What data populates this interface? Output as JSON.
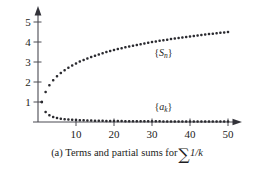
{
  "caption": {
    "prefix": "(a) Terms and partial sums for",
    "sigma": "∑",
    "expression": "1/k",
    "full": "(a) Terms and partial sums for ∑1/k"
  },
  "chart_data": {
    "type": "scatter",
    "title": "",
    "subtitle": "",
    "xlabel": "",
    "ylabel": "",
    "xlim": [
      0,
      52
    ],
    "ylim": [
      0,
      5.4
    ],
    "grid": false,
    "legend_position": "inline-annotation",
    "xticks": [
      10,
      20,
      30,
      40,
      50
    ],
    "xtick_labels": [
      "10",
      "20",
      "30",
      "40",
      "50"
    ],
    "yticks": [
      1,
      2,
      3,
      4,
      5
    ],
    "ytick_labels": [
      "1",
      "2",
      "3",
      "4",
      "5"
    ],
    "x": [
      1,
      2,
      3,
      4,
      5,
      6,
      7,
      8,
      9,
      10,
      11,
      12,
      13,
      14,
      15,
      16,
      17,
      18,
      19,
      20,
      21,
      22,
      23,
      24,
      25,
      26,
      27,
      28,
      29,
      30,
      31,
      32,
      33,
      34,
      35,
      36,
      37,
      38,
      39,
      40,
      41,
      42,
      43,
      44,
      45,
      46,
      47,
      48,
      49,
      50
    ],
    "series": [
      {
        "name": "{S_n}",
        "label_base": "S",
        "label_sub": "n",
        "description": "partial sums of the harmonic series",
        "annotation_x": 33,
        "annotation_y": 3.3,
        "values": [
          1.0,
          1.5,
          1.833,
          2.083,
          2.283,
          2.45,
          2.593,
          2.718,
          2.829,
          2.929,
          3.02,
          3.103,
          3.18,
          3.252,
          3.318,
          3.381,
          3.44,
          3.495,
          3.548,
          3.598,
          3.645,
          3.691,
          3.734,
          3.776,
          3.816,
          3.854,
          3.891,
          3.927,
          3.962,
          3.995,
          4.027,
          4.059,
          4.089,
          4.118,
          4.147,
          4.175,
          4.202,
          4.228,
          4.253,
          4.278,
          4.303,
          4.327,
          4.35,
          4.372,
          4.394,
          4.416,
          4.437,
          4.458,
          4.479,
          4.499
        ]
      },
      {
        "name": "{a_k}",
        "label_base": "a",
        "label_sub": "k",
        "description": "terms 1/k",
        "annotation_x": 33,
        "annotation_y": 0.62,
        "values": [
          1.0,
          0.5,
          0.3333,
          0.25,
          0.2,
          0.1667,
          0.1429,
          0.125,
          0.1111,
          0.1,
          0.0909,
          0.0833,
          0.0769,
          0.0714,
          0.0667,
          0.0625,
          0.0588,
          0.0556,
          0.0526,
          0.05,
          0.0476,
          0.0455,
          0.0435,
          0.0417,
          0.04,
          0.0385,
          0.037,
          0.0357,
          0.0345,
          0.0333,
          0.0323,
          0.0313,
          0.0303,
          0.0294,
          0.0286,
          0.0278,
          0.027,
          0.0263,
          0.0256,
          0.025,
          0.0244,
          0.0238,
          0.0233,
          0.0227,
          0.0222,
          0.0217,
          0.0213,
          0.0208,
          0.0204,
          0.02
        ]
      }
    ],
    "colors": {
      "marker": "#2b2b30",
      "axis": "#4a4a52",
      "text": "#1d1d22",
      "background": "#ffffff"
    }
  }
}
